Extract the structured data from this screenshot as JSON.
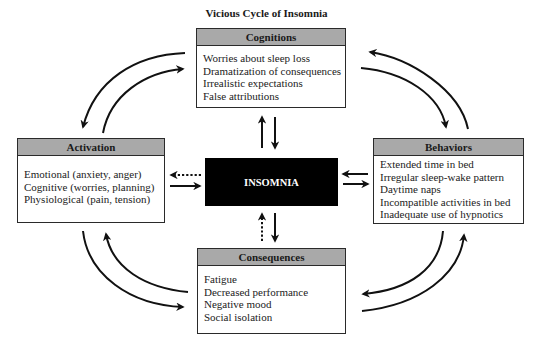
{
  "title": "Vicious Cycle of Insomnia",
  "center": {
    "label": "INSOMNIA"
  },
  "boxes": {
    "cognitions": {
      "title": "Cognitions",
      "items": [
        "Worries about sleep loss",
        "Dramatization of consequences",
        "Irrealistic expectations",
        "False attributions"
      ]
    },
    "activation": {
      "title": "Activation",
      "items": [
        "Emotional (anxiety, anger)",
        "Cognitive (worries, planning)",
        "Physiological (pain, tension)"
      ]
    },
    "behaviors": {
      "title": "Behaviors",
      "items": [
        "Extended time in bed",
        "Irregular sleep-wake pattern",
        "Daytime naps",
        "Incompatible activities in bed",
        "Inadequate use of hypnotics"
      ]
    },
    "consequences": {
      "title": "Consequences",
      "items": [
        "Fatigue",
        "Decreased performance",
        "Negative mood",
        "Social isolation"
      ]
    }
  },
  "colors": {
    "header_fill": "#a9a9a9",
    "center_fill": "#000000",
    "border": "#2a2a2a"
  },
  "connections": [
    {
      "from": "Cognitions",
      "to": "INSOMNIA",
      "style": "solid"
    },
    {
      "from": "INSOMNIA",
      "to": "Cognitions",
      "style": "solid"
    },
    {
      "from": "Activation",
      "to": "INSOMNIA",
      "style": "solid"
    },
    {
      "from": "INSOMNIA",
      "to": "Activation",
      "style": "dotted"
    },
    {
      "from": "Behaviors",
      "to": "INSOMNIA",
      "style": "solid"
    },
    {
      "from": "INSOMNIA",
      "to": "Behaviors",
      "style": "solid"
    },
    {
      "from": "INSOMNIA",
      "to": "Consequences",
      "style": "solid"
    },
    {
      "from": "Consequences",
      "to": "INSOMNIA",
      "style": "dotted"
    },
    {
      "from": "Cognitions",
      "to": "Activation",
      "style": "curved"
    },
    {
      "from": "Activation",
      "to": "Cognitions",
      "style": "curved"
    },
    {
      "from": "Cognitions",
      "to": "Behaviors",
      "style": "curved"
    },
    {
      "from": "Behaviors",
      "to": "Cognitions",
      "style": "curved"
    },
    {
      "from": "Activation",
      "to": "Consequences",
      "style": "curved"
    },
    {
      "from": "Consequences",
      "to": "Activation",
      "style": "curved"
    },
    {
      "from": "Behaviors",
      "to": "Consequences",
      "style": "curved"
    },
    {
      "from": "Consequences",
      "to": "Behaviors",
      "style": "curved"
    }
  ]
}
